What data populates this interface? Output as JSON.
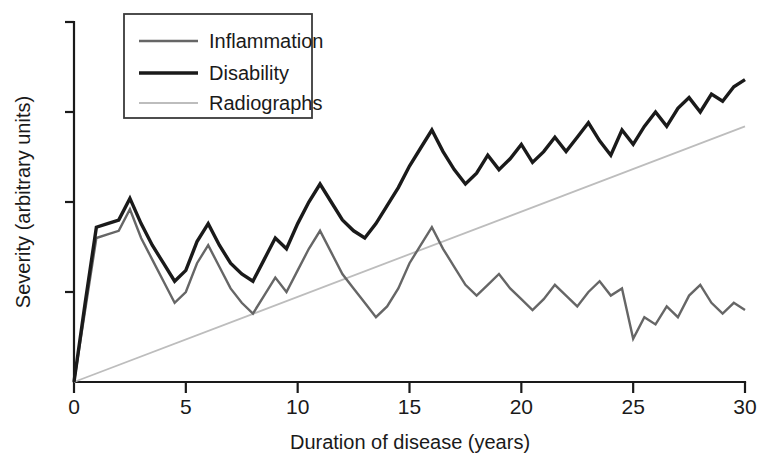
{
  "chart_data": {
    "type": "line",
    "title": "",
    "xlabel": "Duration of disease (years)",
    "ylabel": "Severity (arbitrary units)",
    "xlim": [
      0,
      30
    ],
    "ylim": [
      0,
      100
    ],
    "xticks": [
      0,
      5,
      10,
      15,
      20,
      25,
      30
    ],
    "xtick_labels": [
      "0",
      "5",
      "10",
      "15",
      "20",
      "25",
      "30"
    ],
    "yticks": [
      25,
      50,
      75,
      100
    ],
    "ytick_labels": [
      "",
      "",
      "",
      ""
    ],
    "grid": false,
    "legend_position": "top-left",
    "series": [
      {
        "name": "Inflammation",
        "color": "#666666",
        "width": 2.4,
        "x": [
          0,
          0.5,
          1,
          1.5,
          2,
          2.5,
          3,
          3.5,
          4,
          4.5,
          5,
          5.5,
          6,
          6.5,
          7,
          7.5,
          8,
          8.5,
          9,
          9.5,
          10,
          10.5,
          11,
          11.5,
          12,
          12.5,
          13,
          13.5,
          14,
          14.5,
          15,
          15.5,
          16,
          16.5,
          17,
          17.5,
          18,
          18.5,
          19,
          19.5,
          20,
          20.5,
          21,
          21.5,
          22,
          22.5,
          23,
          23.5,
          24,
          24.5,
          25,
          25.5,
          26,
          26.5,
          27,
          27.5,
          28,
          28.5,
          29,
          29.5,
          30
        ],
        "values": [
          0,
          20,
          40,
          41,
          42,
          48,
          40,
          34,
          28,
          22,
          25,
          33,
          38,
          32,
          26,
          22,
          19,
          24,
          29,
          25,
          31,
          37,
          42,
          36,
          30,
          26,
          22,
          18,
          21,
          26,
          33,
          38,
          43,
          37,
          32,
          27,
          24,
          27,
          30,
          26,
          23,
          20,
          23,
          27,
          24,
          21,
          25,
          28,
          24,
          26,
          12,
          18,
          16,
          21,
          18,
          24,
          27,
          22,
          19,
          22,
          20
        ]
      },
      {
        "name": "Disability",
        "color": "#1a1a1a",
        "width": 3.4,
        "x": [
          0,
          0.5,
          1,
          1.5,
          2,
          2.5,
          3,
          3.5,
          4,
          4.5,
          5,
          5.5,
          6,
          6.5,
          7,
          7.5,
          8,
          8.5,
          9,
          9.5,
          10,
          10.5,
          11,
          11.5,
          12,
          12.5,
          13,
          13.5,
          14,
          14.5,
          15,
          15.5,
          16,
          16.5,
          17,
          17.5,
          18,
          18.5,
          19,
          19.5,
          20,
          20.5,
          21,
          21.5,
          22,
          22.5,
          23,
          23.5,
          24,
          24.5,
          25,
          25.5,
          26,
          26.5,
          27,
          27.5,
          28,
          28.5,
          29,
          29.5,
          30
        ],
        "values": [
          0,
          22,
          43,
          44,
          45,
          51,
          44,
          38,
          33,
          28,
          31,
          39,
          44,
          38,
          33,
          30,
          28,
          34,
          40,
          37,
          44,
          50,
          55,
          50,
          45,
          42,
          40,
          44,
          49,
          54,
          60,
          65,
          70,
          64,
          59,
          55,
          58,
          63,
          59,
          62,
          66,
          61,
          64,
          68,
          64,
          68,
          72,
          67,
          63,
          70,
          66,
          71,
          75,
          71,
          76,
          79,
          75,
          80,
          78,
          82,
          84
        ]
      },
      {
        "name": "Radiographs",
        "color": "#bdbdbd",
        "width": 1.8,
        "x": [
          0,
          30
        ],
        "values": [
          0,
          71
        ]
      }
    ]
  },
  "legend": {
    "items": [
      {
        "label": "Inflammation"
      },
      {
        "label": "Disability"
      },
      {
        "label": "Radiographs"
      }
    ]
  }
}
